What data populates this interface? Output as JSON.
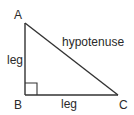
{
  "diagram": {
    "stroke_color": "#333333",
    "text_color": "#2a2a2a",
    "vertices": {
      "A": {
        "label": "A",
        "x": 25,
        "y": 23
      },
      "B": {
        "label": "B",
        "x": 25,
        "y": 95
      },
      "C": {
        "label": "C",
        "x": 118,
        "y": 95
      }
    },
    "sides": {
      "vertical_leg": {
        "label": "leg"
      },
      "horizontal_leg": {
        "label": "leg"
      },
      "hypotenuse": {
        "label": "hypotenuse"
      }
    },
    "right_angle_marker": {
      "at": "B",
      "size": 12
    }
  }
}
